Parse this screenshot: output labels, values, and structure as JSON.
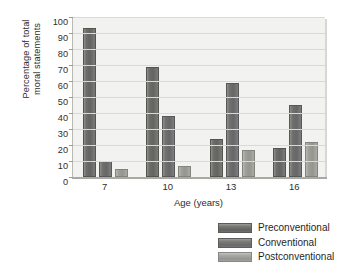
{
  "chart_data": {
    "type": "bar",
    "title": "",
    "xlabel": "Age (years)",
    "ylabel": "Percentage of total moral statements",
    "ylabel_lines": [
      "Percentage of total",
      "moral statements"
    ],
    "categories": [
      "7",
      "10",
      "13",
      "16"
    ],
    "series": [
      {
        "name": "Preconventional",
        "values": [
          93,
          69,
          24,
          18
        ],
        "color": "#6d6d6a"
      },
      {
        "name": "Conventional",
        "values": [
          10,
          38,
          59,
          45
        ],
        "color": "#70706e"
      },
      {
        "name": "Postconventional",
        "values": [
          5,
          7,
          17,
          22
        ],
        "color": "#9d9d9a"
      }
    ],
    "ylim": [
      0,
      100
    ],
    "yticks": [
      0,
      10,
      20,
      30,
      40,
      50,
      60,
      70,
      80,
      90,
      100
    ],
    "ytick_labels": [
      "0",
      "10",
      "20",
      "30",
      "40",
      "50",
      "60",
      "70",
      "80",
      "90",
      "100"
    ],
    "grid": true,
    "grid_axis": "y",
    "legend_position": "bottom-right",
    "plot_background": "#f2f2f0"
  },
  "legend": {
    "entries": [
      {
        "label": "Preconventional"
      },
      {
        "label": "Conventional"
      },
      {
        "label": "Postconventional"
      }
    ]
  }
}
